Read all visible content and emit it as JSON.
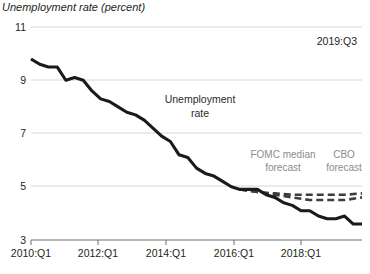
{
  "chart_data": {
    "type": "line",
    "title": "Unemployment rate (percent)",
    "xlabel": "",
    "ylabel": "",
    "ylim": [
      3,
      11
    ],
    "yticks": [
      3,
      5,
      7,
      9,
      11
    ],
    "ytick_labels": [
      "3",
      "5",
      "7",
      "9",
      "11"
    ],
    "xlim": [
      "2010:Q1",
      "2019:Q3"
    ],
    "xticks": [
      "2010:Q1",
      "2012:Q1",
      "2014:Q1",
      "2016:Q1",
      "2018:Q1"
    ],
    "grid": "horizontal",
    "legend": "none",
    "annotations": [
      {
        "name": "date-stamp",
        "text": "2019:Q3",
        "x": 0.88,
        "y": 10.4
      },
      {
        "name": "series-label-unemployment",
        "text_line1": "Unemployment",
        "text_line2": "rate",
        "x": 0.52,
        "y": 8.1
      },
      {
        "name": "series-label-fomc",
        "text_line1": "FOMC median",
        "text_line2": "forecast",
        "x": 0.76,
        "y": 6.1
      },
      {
        "name": "series-label-cbo",
        "text_line1": "CBO",
        "text_line2": "forecast",
        "x": 0.95,
        "y": 6.1
      }
    ],
    "series": [
      {
        "name": "Unemployment rate",
        "style": "solid",
        "color": "#1a1a1a",
        "x": [
          "2010:Q1",
          "2010:Q2",
          "2010:Q3",
          "2010:Q4",
          "2011:Q1",
          "2011:Q2",
          "2011:Q3",
          "2011:Q4",
          "2012:Q1",
          "2012:Q2",
          "2012:Q3",
          "2012:Q4",
          "2013:Q1",
          "2013:Q2",
          "2013:Q3",
          "2013:Q4",
          "2014:Q1",
          "2014:Q2",
          "2014:Q3",
          "2014:Q4",
          "2015:Q1",
          "2015:Q2",
          "2015:Q3",
          "2015:Q4",
          "2016:Q1",
          "2016:Q2",
          "2016:Q3",
          "2016:Q4",
          "2017:Q1",
          "2017:Q2",
          "2017:Q3",
          "2017:Q4",
          "2018:Q1",
          "2018:Q2",
          "2018:Q3",
          "2018:Q4",
          "2019:Q1",
          "2019:Q2",
          "2019:Q3"
        ],
        "values": [
          9.8,
          9.6,
          9.5,
          9.5,
          9.0,
          9.1,
          9.0,
          8.6,
          8.3,
          8.2,
          8.0,
          7.8,
          7.7,
          7.5,
          7.2,
          6.9,
          6.7,
          6.2,
          6.1,
          5.7,
          5.5,
          5.4,
          5.2,
          5.0,
          4.9,
          4.9,
          4.9,
          4.7,
          4.6,
          4.4,
          4.3,
          4.1,
          4.1,
          3.9,
          3.8,
          3.8,
          3.9,
          3.6,
          3.6
        ]
      },
      {
        "name": "FOMC median forecast",
        "style": "dashed",
        "color": "#3d3d3d",
        "x": [
          "2016:Q1",
          "2016:Q3",
          "2017:Q1",
          "2017:Q3",
          "2018:Q1",
          "2018:Q3",
          "2019:Q1",
          "2019:Q3"
        ],
        "values": [
          4.9,
          4.8,
          4.7,
          4.6,
          4.5,
          4.5,
          4.5,
          4.6
        ]
      },
      {
        "name": "CBO forecast",
        "style": "dashed",
        "color": "#3d3d3d",
        "x": [
          "2016:Q1",
          "2016:Q3",
          "2017:Q1",
          "2017:Q3",
          "2018:Q1",
          "2018:Q3",
          "2019:Q1",
          "2019:Q3"
        ],
        "values": [
          4.9,
          4.8,
          4.75,
          4.7,
          4.7,
          4.7,
          4.7,
          4.75
        ]
      }
    ]
  },
  "colors": {
    "actual": "#1a1a1a",
    "forecast": "#3d3d3d",
    "grid": "#d6d6d6",
    "axis": "#6f6f6f",
    "label_gray": "#8c8c8c",
    "text": "#231f20"
  }
}
